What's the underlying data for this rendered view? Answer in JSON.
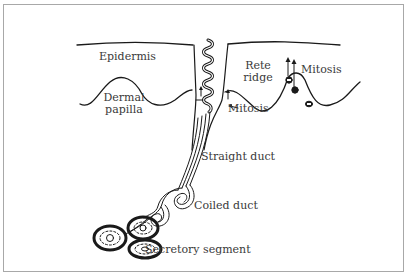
{
  "diagram": {
    "labels": {
      "epidermis": "Epidermis",
      "rete_ridge_line1": "Rete",
      "rete_ridge_line2": "ridge",
      "mitosis_top": "Mitosis",
      "dermal_papilla_line1": "Dermal",
      "dermal_papilla_line2": "papilla",
      "mitosis_duct": "Mitosis",
      "straight_duct": "Straight duct",
      "coiled_duct": "Coiled duct",
      "secretory_segment": "Secretory segment"
    },
    "colors": {
      "line": "#1a1a1a",
      "text": "#3a3a3a",
      "frame": "#a8a8a8",
      "background": "#ffffff"
    }
  }
}
